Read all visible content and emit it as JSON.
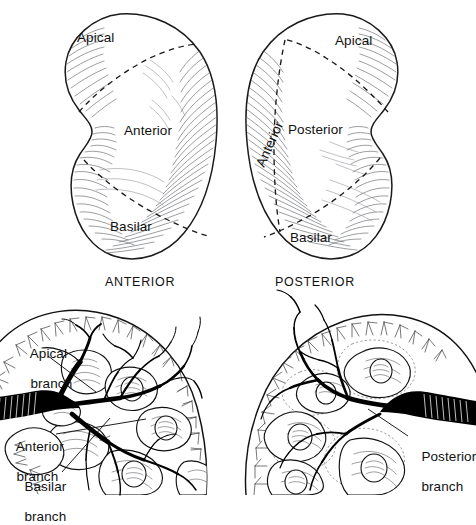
{
  "figure": {
    "title_visible": false,
    "background_color": "#ffffff",
    "ink_color": "#000000",
    "hatch_color": "#5f6166"
  },
  "top_row": {
    "left_view": {
      "caption": "ANTERIOR",
      "segment_labels": [
        {
          "name": "apical",
          "text": "Apical"
        },
        {
          "name": "anterior",
          "text": "Anterior"
        },
        {
          "name": "basilar",
          "text": "Basilar"
        }
      ]
    },
    "right_view": {
      "caption": "POSTERIOR",
      "segment_labels": [
        {
          "name": "apical",
          "text": "Apical"
        },
        {
          "name": "anterior",
          "text": "Anterior"
        },
        {
          "name": "posterior",
          "text": "Posterior"
        },
        {
          "name": "basilar",
          "text": "Basilar"
        }
      ]
    }
  },
  "bottom_row": {
    "left_section": {
      "leader_labels": [
        {
          "name": "apical-branch",
          "line1": "Apical",
          "line2": "branch"
        },
        {
          "name": "anterior-branch",
          "line1": "Anterior",
          "line2": "branch"
        },
        {
          "name": "basilar-branch",
          "line1": "Basilar",
          "line2": "branch"
        }
      ]
    },
    "right_section": {
      "leader_labels": [
        {
          "name": "posterior-branch",
          "line1": "Posterior",
          "line2": "branch"
        }
      ]
    }
  }
}
